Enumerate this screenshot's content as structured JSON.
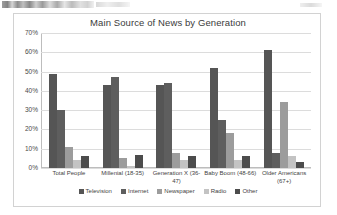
{
  "page": {
    "artifact_note": "scanned-page-top-edge"
  },
  "chart_data": {
    "type": "bar",
    "title": "Main Source of News by Generation",
    "xlabel": "",
    "ylabel": "",
    "ylim": [
      0,
      70
    ],
    "ytick_labels": [
      "70%",
      "60%",
      "50%",
      "40%",
      "30%",
      "20%",
      "10%",
      "0%"
    ],
    "ytick_values": [
      70,
      60,
      50,
      40,
      30,
      20,
      10,
      0
    ],
    "grid": true,
    "legend_position": "bottom",
    "categories": [
      "Total People",
      "Millenial (18-35)",
      "Generation X (36-47)",
      "Baby Boom (48-66)",
      "Older Americans\n(67+)"
    ],
    "series": [
      {
        "name": "Television",
        "color": "#555555",
        "values": [
          49,
          43,
          43,
          52,
          61
        ]
      },
      {
        "name": "Internet",
        "color": "#5e5e5e",
        "values": [
          30,
          47,
          44,
          25,
          8
        ]
      },
      {
        "name": "Newspaper",
        "color": "#9c9c9c",
        "values": [
          11,
          5,
          8,
          18,
          34
        ]
      },
      {
        "name": "Radio",
        "color": "#c3c3c3",
        "values": [
          4,
          1,
          4,
          4,
          6
        ]
      },
      {
        "name": "Other",
        "color": "#4c4c4c",
        "values": [
          6,
          7,
          6,
          6,
          3
        ]
      }
    ]
  }
}
